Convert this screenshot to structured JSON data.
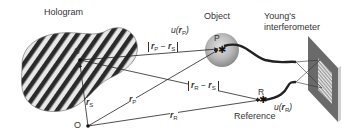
{
  "labels": {
    "hologram": "Hologram",
    "object": "Object",
    "interferometer_line1": "Young's",
    "interferometer_line2": "interferometer",
    "reference": "Reference",
    "point_S": "S",
    "point_P": "P",
    "point_R": "R",
    "point_O": "O"
  },
  "math": {
    "uP": {
      "func": "u(",
      "vec": "r",
      "sub": "P",
      "close": ")"
    },
    "uR": {
      "func": "u(",
      "vec": "r",
      "sub": "R",
      "close": ")"
    },
    "rP_minus_rS": {
      "a": "r",
      "a_sub": "P",
      "op": " − ",
      "b": "r",
      "b_sub": "S"
    },
    "rR_minus_rS": {
      "a": "r",
      "a_sub": "R",
      "op": " − ",
      "b": "r",
      "b_sub": "S"
    },
    "rS": {
      "vec": "r",
      "sub": "S"
    },
    "rP": {
      "vec": "r",
      "sub": "P"
    },
    "rR": {
      "vec": "r",
      "sub": "R"
    }
  },
  "colors": {
    "line": "#333333",
    "stripe_dark": "#2a2a2a",
    "stripe_light": "#e8e8e8",
    "sphere_center": "#d8d8d8",
    "sphere_edge": "#8a8a8a",
    "screen": "#6a6a6a"
  }
}
